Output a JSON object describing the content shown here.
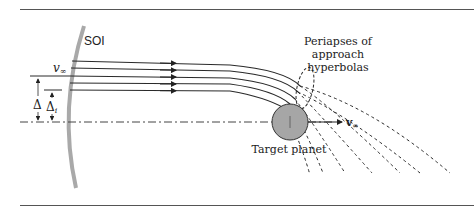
{
  "labels": {
    "soi": "SOI",
    "v_inf_left": "v",
    "v_inf_left_sub": "∞",
    "delta": "Δ",
    "delta_i": "Δ",
    "delta_i_sub": "i",
    "periapses_line1": "Periapses of",
    "periapses_line2": "approach",
    "periapses_line3": "hyperbolas",
    "v_inf_right": "v",
    "v_inf_right_sub": "∞",
    "target_planet": "Target planet"
  },
  "colors": {
    "soi_arc": "#a9a9a9",
    "planet_fill": "#a6a6a6",
    "line": "#2a2a2a",
    "rule": "#555555"
  }
}
